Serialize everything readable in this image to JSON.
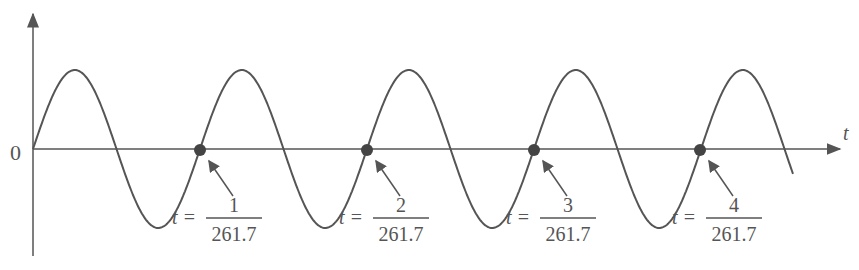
{
  "figure": {
    "type": "sine-wave-diagram",
    "y_axis_origin_label": "0",
    "x_axis_label": "t",
    "stroke_color": "#555555",
    "dot_color": "#444444",
    "markers": [
      {
        "prefix": "t =",
        "numerator": "1",
        "denominator": "261.7"
      },
      {
        "prefix": "t =",
        "numerator": "2",
        "denominator": "261.7"
      },
      {
        "prefix": "t =",
        "numerator": "3",
        "denominator": "261.7"
      },
      {
        "prefix": "t =",
        "numerator": "4",
        "denominator": "261.7"
      }
    ]
  }
}
